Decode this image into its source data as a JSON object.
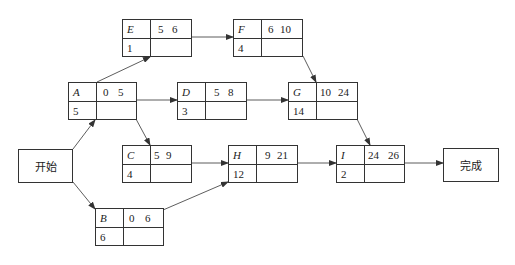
{
  "diagram": {
    "type": "activity-on-node network",
    "start": {
      "label": "开始"
    },
    "end": {
      "label": "完成"
    },
    "nodes": [
      {
        "id": "A",
        "duration": "5",
        "es": "0",
        "ef": "5"
      },
      {
        "id": "B",
        "duration": "6",
        "es": "0",
        "ef": "6"
      },
      {
        "id": "C",
        "duration": "4",
        "es": "5",
        "ef": "9"
      },
      {
        "id": "D",
        "duration": "3",
        "es": "5",
        "ef": "8"
      },
      {
        "id": "E",
        "duration": "1",
        "es": "5",
        "ef": "6"
      },
      {
        "id": "F",
        "duration": "4",
        "es": "6",
        "ef": "10"
      },
      {
        "id": "G",
        "duration": "14",
        "es": "10",
        "ef": "24"
      },
      {
        "id": "H",
        "duration": "12",
        "es": "9",
        "ef": "21"
      },
      {
        "id": "I",
        "duration": "2",
        "es": "24",
        "ef": "26"
      }
    ],
    "edges": [
      [
        "开始",
        "A"
      ],
      [
        "开始",
        "B"
      ],
      [
        "A",
        "E"
      ],
      [
        "A",
        "D"
      ],
      [
        "A",
        "C"
      ],
      [
        "E",
        "F"
      ],
      [
        "F",
        "G"
      ],
      [
        "D",
        "G"
      ],
      [
        "C",
        "H"
      ],
      [
        "B",
        "H"
      ],
      [
        "G",
        "I"
      ],
      [
        "H",
        "I"
      ],
      [
        "I",
        "完成"
      ]
    ]
  }
}
